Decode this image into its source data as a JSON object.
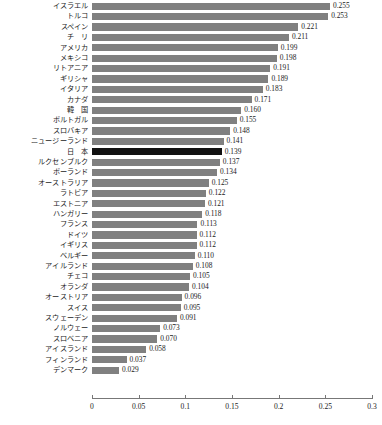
{
  "chart_data": {
    "type": "bar",
    "orientation": "horizontal",
    "title": "",
    "xlabel": "",
    "ylabel": "",
    "xlim": [
      0,
      0.3
    ],
    "xticks": [
      "0",
      "0.05",
      "0.1",
      "0.15",
      "0.2",
      "0.25",
      "0.3"
    ],
    "xtick_values": [
      0,
      0.05,
      0.1,
      0.15,
      0.2,
      0.25,
      0.3
    ],
    "grid": false,
    "legend": null,
    "bar_color": "#808080",
    "highlight_color": "#111111",
    "highlight_category": "日　本",
    "categories": [
      "イスラエル",
      "トルコ",
      "スペイン",
      "チ　リ",
      "アメリカ",
      "メキシコ",
      "リトアニア",
      "ギリシャ",
      "イタリア",
      "カナダ",
      "韓　国",
      "ポルトガル",
      "スロバキア",
      "ニュージーランド",
      "日　本",
      "ルクセンブルク",
      "ポーランド",
      "オーストラリア",
      "ラトビア",
      "エストニア",
      "ハンガリー",
      "フランス",
      "ドイツ",
      "イギリス",
      "ベルギー",
      "アイルランド",
      "チェコ",
      "オランダ",
      "オーストリア",
      "スイス",
      "スウェーデン",
      "ノルウェー",
      "スロベニア",
      "アイスランド",
      "フィンランド",
      "デンマーク"
    ],
    "values": [
      0.255,
      0.253,
      0.221,
      0.211,
      0.199,
      0.198,
      0.191,
      0.189,
      0.183,
      0.171,
      0.16,
      0.155,
      0.148,
      0.141,
      0.139,
      0.137,
      0.134,
      0.125,
      0.122,
      0.121,
      0.118,
      0.113,
      0.112,
      0.112,
      0.11,
      0.108,
      0.105,
      0.104,
      0.096,
      0.095,
      0.091,
      0.073,
      0.07,
      0.058,
      0.037,
      0.029
    ],
    "value_labels": [
      "0.255",
      "0.253",
      "0.221",
      "0.211",
      "0.199",
      "0.198",
      "0.191",
      "0.189",
      "0.183",
      "0.171",
      "0.160",
      "0.155",
      "0.148",
      "0.141",
      "0.139",
      "0.137",
      "0.134",
      "0.125",
      "0.122",
      "0.121",
      "0.118",
      "0.113",
      "0.112",
      "0.112",
      "0.110",
      "0.108",
      "0.105",
      "0.104",
      "0.096",
      "0.095",
      "0.091",
      "0.073",
      "0.070",
      "0.058",
      "0.037",
      "0.029"
    ]
  }
}
